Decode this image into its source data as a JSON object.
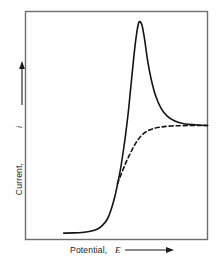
{
  "figure": {
    "background_color": "#ffffff",
    "frame_color": "#6e6e6e",
    "curve_color": "#141414",
    "axis_labels": {
      "x": {
        "text": "Potential,",
        "symbol": "E",
        "arrow": "right-arrow-icon"
      },
      "y": {
        "text": "Current,",
        "symbol": "i",
        "arrow": "up-arrow-icon"
      }
    }
  },
  "chart_data": {
    "type": "line",
    "title": "",
    "xlabel": "Potential, E",
    "ylabel": "Current, i",
    "xlim": [
      0,
      1
    ],
    "ylim": [
      0,
      1
    ],
    "grid": false,
    "legend": "none",
    "axis_ticks": {
      "x": [],
      "y": []
    },
    "annotations": [],
    "series": [
      {
        "name": "peak-shaped voltammogram",
        "style": "solid",
        "color": "#141414",
        "width": 1.6,
        "x": [
          0.21,
          0.26,
          0.31,
          0.35,
          0.39,
          0.42,
          0.45,
          0.47,
          0.49,
          0.505,
          0.52,
          0.535,
          0.55,
          0.565,
          0.575,
          0.585,
          0.595,
          0.605,
          0.615,
          0.625,
          0.64,
          0.655,
          0.67,
          0.69,
          0.715,
          0.745,
          0.78,
          0.82,
          0.87,
          0.93,
          1.0
        ],
        "y": [
          0.028,
          0.029,
          0.031,
          0.035,
          0.044,
          0.06,
          0.09,
          0.13,
          0.185,
          0.24,
          0.3,
          0.375,
          0.46,
          0.56,
          0.64,
          0.72,
          0.8,
          0.87,
          0.925,
          0.955,
          0.94,
          0.875,
          0.79,
          0.705,
          0.63,
          0.575,
          0.54,
          0.52,
          0.508,
          0.503,
          0.5
        ]
      },
      {
        "name": "sigmoidal steady-state wave",
        "style": "dashed",
        "color": "#141414",
        "width": 1.6,
        "dash": "4,3",
        "x": [
          0.505,
          0.52,
          0.535,
          0.55,
          0.565,
          0.58,
          0.6,
          0.62,
          0.645,
          0.675,
          0.71,
          0.75,
          0.8,
          0.855,
          0.91,
          0.96,
          1.0
        ],
        "y": [
          0.245,
          0.275,
          0.305,
          0.335,
          0.36,
          0.385,
          0.415,
          0.44,
          0.462,
          0.478,
          0.488,
          0.494,
          0.498,
          0.499,
          0.5,
          0.5,
          0.5
        ]
      }
    ]
  }
}
